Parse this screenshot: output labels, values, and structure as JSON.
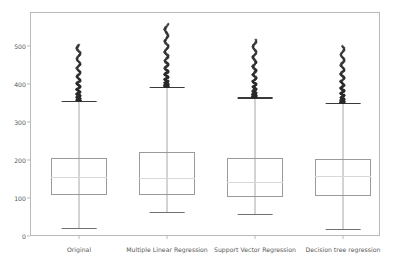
{
  "chart_data": {
    "type": "box",
    "title": "",
    "xlabel": "",
    "ylabel": "",
    "ylim": [
      0,
      560
    ],
    "grid": false,
    "legend": null,
    "yticks": [
      0,
      100,
      200,
      300,
      400,
      500
    ],
    "ytick_labels": [
      "0",
      "100",
      "200",
      "300",
      "400",
      "500"
    ],
    "categories": [
      "Original",
      "Multiple Linear Regression",
      "Support Vector Regression",
      "Decision tree regression"
    ],
    "boxes": [
      {
        "label": "Original",
        "whisker_low": 22,
        "q1": 108,
        "median": 155,
        "q3": 205,
        "whisker_high": 355,
        "outlier_max": 503,
        "outlier_count_note": "dense cluster 355-503"
      },
      {
        "label": "Multiple Linear Regression",
        "whisker_low": 62,
        "q1": 107,
        "median": 152,
        "q3": 221,
        "whisker_high": 393,
        "outlier_max": 558,
        "outlier_count_note": "dense cluster 393-520, sparse to 558"
      },
      {
        "label": "Support Vector Regression",
        "whisker_low": 58,
        "q1": 103,
        "median": 143,
        "q3": 206,
        "whisker_high": 365,
        "outlier_max": 516,
        "outlier_count_note": "dense cluster 365-500, sparse to 516"
      },
      {
        "label": "Decision tree regression",
        "whisker_low": 19,
        "q1": 104,
        "median": 158,
        "q3": 203,
        "whisker_high": 350,
        "outlier_max": 499,
        "outlier_count_note": "dense cluster 350-480, sparse to 499"
      }
    ]
  },
  "axis": {
    "ytick_0": "0",
    "ytick_100": "100",
    "ytick_200": "200",
    "ytick_300": "300",
    "ytick_400": "400",
    "ytick_500": "500"
  },
  "xaxis": {
    "label_1": "Original",
    "label_2": "Multiple Linear Regression",
    "label_3": "Support Vector Regression",
    "label_4": "Decision tree regression"
  },
  "colors": {
    "frame": "#b9b9b9",
    "box_edge": "#9a9a9a",
    "whisker": "#a8a8a8",
    "cap": "#3a3a3a",
    "median": "#d8d8d8",
    "outlier": "#2b2b2b",
    "tick_text": "#595959",
    "background": "#ffffff"
  }
}
